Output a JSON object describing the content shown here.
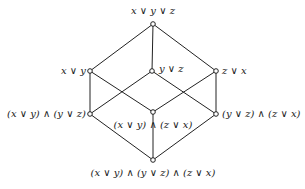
{
  "diagram": {
    "type": "lattice",
    "nodes": [
      {
        "id": "top",
        "label": "x ∨ y ∨ z",
        "x": 153,
        "y": 24,
        "lx": 153,
        "ly": 5,
        "anchor": "center"
      },
      {
        "id": "xy",
        "label": "x ∨ y",
        "x": 90,
        "y": 71,
        "lx": 86,
        "ly": 65,
        "anchor": "right"
      },
      {
        "id": "yz",
        "label": "y ∨ z",
        "x": 152,
        "y": 71,
        "lx": 159,
        "ly": 63,
        "anchor": "left"
      },
      {
        "id": "zx",
        "label": "z ∨ x",
        "x": 216,
        "y": 71,
        "lx": 222,
        "ly": 65,
        "anchor": "left"
      },
      {
        "id": "xy_yz",
        "label": "(x ∨ y) ∧ (y ∨ z)",
        "x": 90,
        "y": 114,
        "lx": 86,
        "ly": 108,
        "anchor": "right"
      },
      {
        "id": "xy_zx",
        "label": "(x ∨ y) ∧ (z ∨ x)",
        "x": 153,
        "y": 112,
        "lx": 153,
        "ly": 119,
        "anchor": "center"
      },
      {
        "id": "yz_zx",
        "label": "(y ∨ z) ∧ (z ∨ x)",
        "x": 216,
        "y": 114,
        "lx": 222,
        "ly": 108,
        "anchor": "left"
      },
      {
        "id": "bottom",
        "label": "(x ∨ y) ∧ (y ∨ z) ∧ (z ∨ x)",
        "x": 153,
        "y": 160,
        "lx": 153,
        "ly": 167,
        "anchor": "center"
      }
    ],
    "edges": [
      [
        "top",
        "xy"
      ],
      [
        "top",
        "yz"
      ],
      [
        "top",
        "zx"
      ],
      [
        "xy",
        "xy_yz"
      ],
      [
        "xy",
        "xy_zx"
      ],
      [
        "yz",
        "xy_yz"
      ],
      [
        "yz",
        "yz_zx"
      ],
      [
        "zx",
        "xy_zx"
      ],
      [
        "zx",
        "yz_zx"
      ],
      [
        "xy_yz",
        "bottom"
      ],
      [
        "xy_zx",
        "bottom"
      ],
      [
        "yz_zx",
        "bottom"
      ]
    ],
    "colors": {
      "line": "#222222",
      "node_fill": "#ffffff",
      "text": "#1a1a1a"
    }
  }
}
